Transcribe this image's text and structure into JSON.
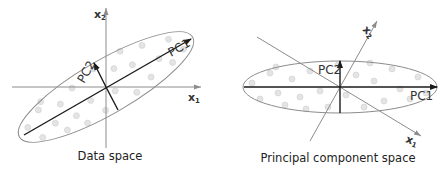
{
  "panels": [
    {
      "id": "data-space",
      "caption": "Data space",
      "axes": [
        {
          "name": "x",
          "sub": "1"
        },
        {
          "name": "x",
          "sub": "2"
        }
      ],
      "components": [
        {
          "label": "PC1"
        },
        {
          "label": "PC2"
        }
      ]
    },
    {
      "id": "principal-component-space",
      "caption": "Principal component space",
      "axes": [
        {
          "name": "x",
          "sub": "1"
        },
        {
          "name": "x",
          "sub": "2"
        }
      ],
      "components": [
        {
          "label": "PC1"
        },
        {
          "label": "PC2"
        }
      ]
    }
  ],
  "colors": {
    "axis": "#8c8c8c",
    "component": "#1a1a1a",
    "point_fill": "#e4e4e4",
    "point_stroke": "#cfcfcf"
  },
  "point_count_per_panel": 24
}
